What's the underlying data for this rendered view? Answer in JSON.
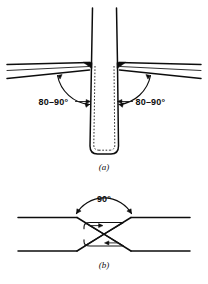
{
  "figure": {
    "background_color": "#ffffff",
    "line_color": "#0d0d0d",
    "width": 208,
    "height": 284,
    "panels": [
      {
        "id": "a",
        "caption": "(a)",
        "description": "tee-joint fillet weld between tapered flange plates and a vertical web plate",
        "angle_label_left": "80–90°",
        "angle_label_right": "80–90°"
      },
      {
        "id": "b",
        "caption": "(b)",
        "description": "double-V (X) groove butt weld between two horizontal plates",
        "angle_label": "90°"
      }
    ]
  },
  "panel_a": {
    "caption": "(a)",
    "left_angle": "80–90°",
    "right_angle": "80–90°"
  },
  "panel_b": {
    "caption": "(b)",
    "groove_angle": "90°"
  }
}
